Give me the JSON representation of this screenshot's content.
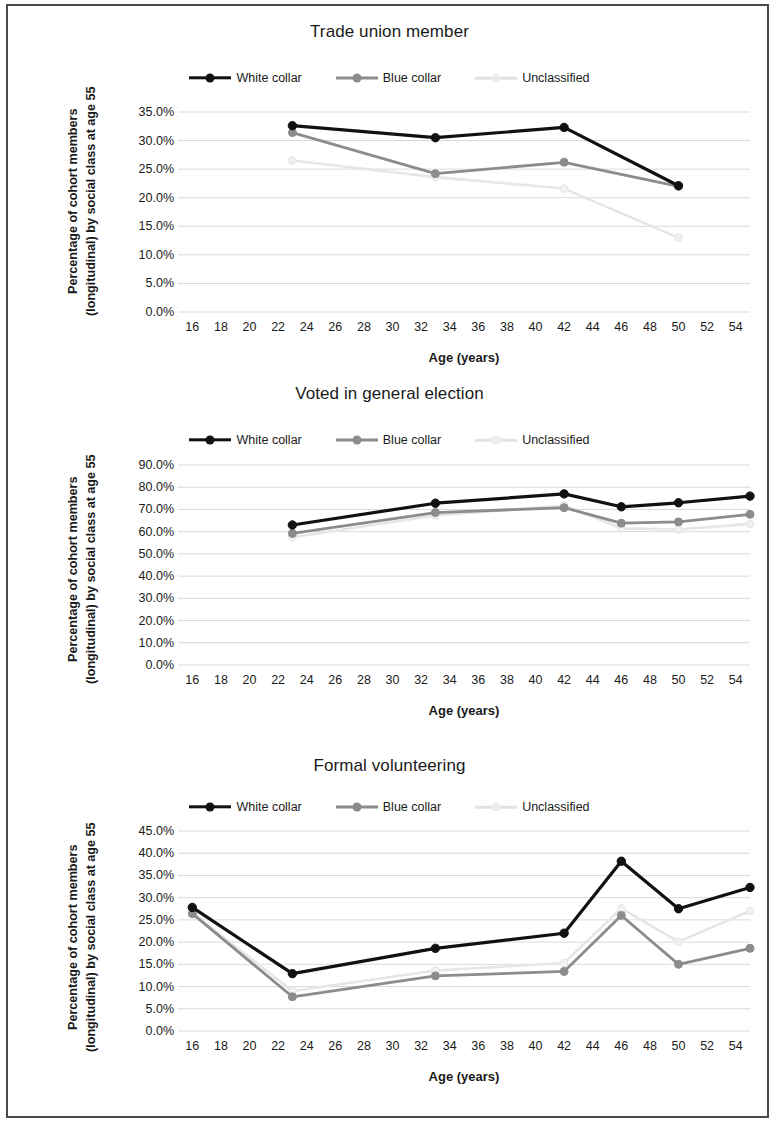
{
  "figure": {
    "y_axis_title": "Percentage of cohort members\n(longitudinal) by social class at age 55",
    "x_axis_title": "Age (years)",
    "legend": [
      {
        "label": "White collar",
        "color": "#111111",
        "key": "white_collar"
      },
      {
        "label": "Blue collar",
        "color": "#8c8c8c",
        "key": "blue_collar"
      },
      {
        "label": "Unclassified",
        "color": "#e6e6e6",
        "key": "unclassified"
      }
    ]
  },
  "chart_data": [
    {
      "type": "line",
      "title": "Trade union member",
      "xlabel": "Age (years)",
      "ylabel": "Percentage of cohort members (longitudinal) by social class at age 55",
      "xlim": [
        15,
        55
      ],
      "ylim": [
        0,
        35
      ],
      "ytick_labels": [
        "0.0%",
        "5.0%",
        "10.0%",
        "15.0%",
        "20.0%",
        "25.0%",
        "30.0%",
        "35.0%"
      ],
      "ytick_values": [
        0,
        5,
        10,
        15,
        20,
        25,
        30,
        35
      ],
      "xtick_labels": [
        "16",
        "18",
        "20",
        "22",
        "24",
        "26",
        "28",
        "30",
        "32",
        "34",
        "36",
        "38",
        "40",
        "42",
        "44",
        "46",
        "48",
        "50",
        "52",
        "54"
      ],
      "xtick_values": [
        16,
        18,
        20,
        22,
        24,
        26,
        28,
        30,
        32,
        34,
        36,
        38,
        40,
        42,
        44,
        46,
        48,
        50,
        52,
        54
      ],
      "grid": true,
      "legend_position": "top-center",
      "series": [
        {
          "name": "White collar",
          "color": "#111111",
          "x": [
            23,
            33,
            42,
            50
          ],
          "values": [
            32.6,
            30.5,
            32.3,
            22.1
          ]
        },
        {
          "name": "Blue collar",
          "color": "#8c8c8c",
          "x": [
            23,
            33,
            42,
            50
          ],
          "values": [
            31.4,
            24.2,
            26.2,
            22.0
          ]
        },
        {
          "name": "Unclassified",
          "color": "#e6e6e6",
          "x": [
            23,
            33,
            42,
            50
          ],
          "values": [
            26.5,
            23.6,
            21.6,
            13.0
          ]
        }
      ]
    },
    {
      "type": "line",
      "title": "Voted in general election",
      "xlabel": "Age (years)",
      "ylabel": "Percentage of cohort members (longitudinal) by social class at age 55",
      "xlim": [
        15,
        55
      ],
      "ylim": [
        0,
        90
      ],
      "ytick_labels": [
        "0.0%",
        "10.0%",
        "20.0%",
        "30.0%",
        "40.0%",
        "50.0%",
        "60.0%",
        "70.0%",
        "80.0%",
        "90.0%"
      ],
      "ytick_values": [
        0,
        10,
        20,
        30,
        40,
        50,
        60,
        70,
        80,
        90
      ],
      "xtick_labels": [
        "16",
        "18",
        "20",
        "22",
        "24",
        "26",
        "28",
        "30",
        "32",
        "34",
        "36",
        "38",
        "40",
        "42",
        "44",
        "46",
        "48",
        "50",
        "52",
        "54"
      ],
      "xtick_values": [
        16,
        18,
        20,
        22,
        24,
        26,
        28,
        30,
        32,
        34,
        36,
        38,
        40,
        42,
        44,
        46,
        48,
        50,
        52,
        54
      ],
      "grid": true,
      "legend_position": "top-center",
      "series": [
        {
          "name": "White collar",
          "color": "#111111",
          "x": [
            23,
            33,
            42,
            46,
            50,
            55
          ],
          "values": [
            63.0,
            72.8,
            77.0,
            71.2,
            73.0,
            76.0
          ]
        },
        {
          "name": "Blue collar",
          "color": "#8c8c8c",
          "x": [
            23,
            33,
            42,
            46,
            50,
            55
          ],
          "values": [
            59.2,
            68.6,
            70.8,
            63.8,
            64.4,
            67.8
          ]
        },
        {
          "name": "Unclassified",
          "color": "#e6e6e6",
          "x": [
            23,
            33,
            42,
            46,
            50,
            55
          ],
          "values": [
            57.5,
            67.3,
            71.8,
            61.5,
            61.0,
            63.5
          ]
        }
      ]
    },
    {
      "type": "line",
      "title": "Formal volunteering",
      "xlabel": "Age (years)",
      "ylabel": "Percentage of cohort members (longitudinal) by social class at age 55",
      "xlim": [
        15,
        55
      ],
      "ylim": [
        0,
        45
      ],
      "ytick_labels": [
        "0.0%",
        "5.0%",
        "10.0%",
        "15.0%",
        "20.0%",
        "25.0%",
        "30.0%",
        "35.0%",
        "40.0%",
        "45.0%"
      ],
      "ytick_values": [
        0,
        5,
        10,
        15,
        20,
        25,
        30,
        35,
        40,
        45
      ],
      "xtick_labels": [
        "16",
        "18",
        "20",
        "22",
        "24",
        "26",
        "28",
        "30",
        "32",
        "34",
        "36",
        "38",
        "40",
        "42",
        "44",
        "46",
        "48",
        "50",
        "52",
        "54"
      ],
      "xtick_values": [
        16,
        18,
        20,
        22,
        24,
        26,
        28,
        30,
        32,
        34,
        36,
        38,
        40,
        42,
        44,
        46,
        48,
        50,
        52,
        54
      ],
      "grid": true,
      "legend_position": "top-center",
      "series": [
        {
          "name": "White collar",
          "color": "#111111",
          "x": [
            16,
            23,
            33,
            42,
            46,
            50,
            55
          ],
          "values": [
            27.8,
            12.9,
            18.6,
            22.0,
            38.2,
            27.5,
            32.3
          ]
        },
        {
          "name": "Blue collar",
          "color": "#8c8c8c",
          "x": [
            16,
            23,
            33,
            42,
            46,
            50,
            55
          ],
          "values": [
            26.4,
            7.7,
            12.4,
            13.4,
            26.0,
            15.0,
            18.6
          ]
        },
        {
          "name": "Unclassified",
          "color": "#e6e6e6",
          "x": [
            16,
            23,
            33,
            42,
            46,
            50,
            55
          ],
          "values": [
            26.6,
            9.0,
            13.6,
            15.3,
            27.6,
            20.1,
            27.0
          ]
        }
      ]
    }
  ]
}
